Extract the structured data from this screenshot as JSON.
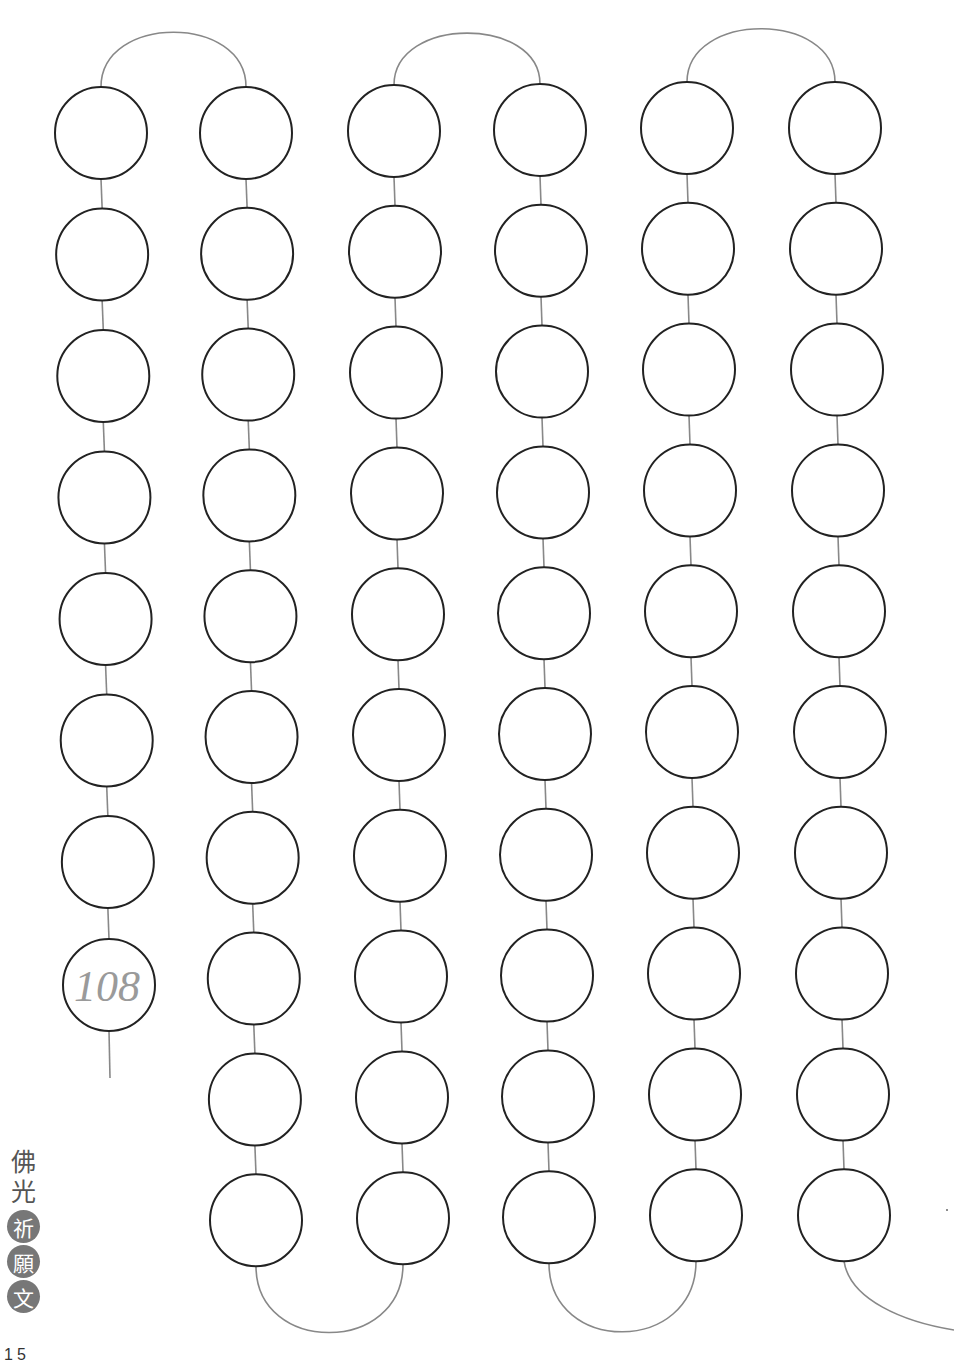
{
  "page": {
    "title_vertical": [
      "佛",
      "光"
    ],
    "title_badges": [
      "祈",
      "願",
      "文"
    ],
    "page_number": "15",
    "final_bead_label": "108"
  },
  "style": {
    "bead_stroke": "#222222",
    "string_color": "#888888",
    "label_color": "#9a9a9a",
    "badge_color": "#777777"
  },
  "bead_columns": [
    {
      "count": 8,
      "direction": "up"
    },
    {
      "count": 10,
      "direction": "down"
    },
    {
      "count": 10,
      "direction": "up"
    },
    {
      "count": 10,
      "direction": "down"
    },
    {
      "count": 10,
      "direction": "up"
    },
    {
      "count": 10,
      "direction": "down"
    }
  ],
  "total_beads_shown": 58
}
